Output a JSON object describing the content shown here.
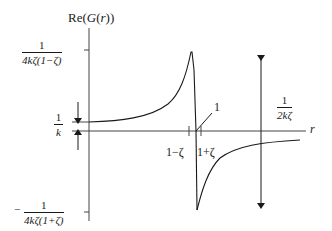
{
  "diagram": {
    "y_axis": {
      "label_prefix": "Re(",
      "label_func": "G",
      "label_arg": "r",
      "label_suffix": "))",
      "label_open": "("
    },
    "x_axis": {
      "label": "r"
    },
    "y_marks": {
      "top": {
        "numerator": "1",
        "denominator": "4kζ(1−ζ)",
        "sign": ""
      },
      "static": {
        "numerator": "1",
        "denominator": "k"
      },
      "bottom": {
        "numerator": "1",
        "denominator": "4kζ(1+ζ)",
        "sign": "−"
      }
    },
    "x_marks": {
      "left": "1−ζ",
      "right": "1+ζ"
    },
    "annotations": {
      "unit_line_label": "1",
      "span": {
        "numerator": "1",
        "denominator": "2kζ"
      }
    },
    "colors": {
      "ink": "#1a1a1a",
      "background": "#ffffff",
      "axis": "#555555"
    }
  }
}
